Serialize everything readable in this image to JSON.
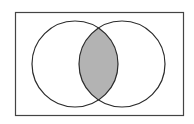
{
  "diagram": {
    "type": "venn",
    "sets": 2,
    "shaded_region": "intersection",
    "colors": {
      "background": "#ffffff",
      "stroke": "#2b2b2b",
      "shade": "#b3b3b3"
    }
  }
}
